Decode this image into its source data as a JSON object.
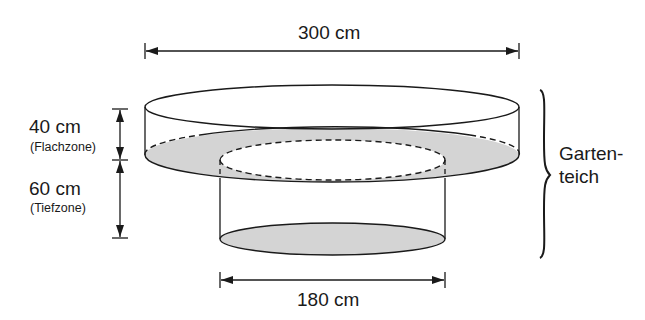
{
  "diagram": {
    "dimensions": {
      "top_diameter": "300 cm",
      "bottom_diameter": "180 cm",
      "shallow_depth": "40 cm",
      "shallow_zone": "(Flachzone)",
      "deep_depth": "60 cm",
      "deep_zone": "(Tiefzone)"
    },
    "side_label": {
      "line1": "Garten-",
      "line2": "teich"
    },
    "colors": {
      "stroke": "#1a1a1a",
      "shade": "#d4d4d4",
      "background": "#ffffff"
    }
  }
}
